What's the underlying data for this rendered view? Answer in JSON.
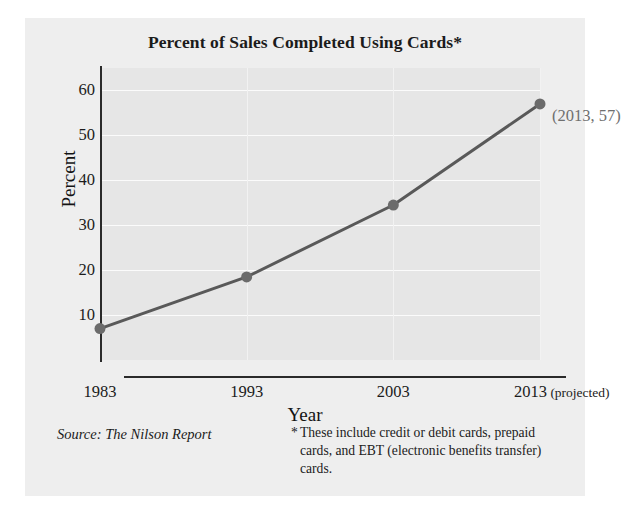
{
  "chart_data": {
    "type": "line",
    "title": "Percent of Sales Completed Using Cards*",
    "xlabel": "Year",
    "ylabel": "Percent",
    "categories": [
      "1983",
      "1993",
      "2003",
      "2013"
    ],
    "x": [
      1983,
      1993,
      2003,
      2013
    ],
    "values": [
      7,
      18.5,
      34.5,
      57
    ],
    "series": [
      {
        "name": "Percent of sales completed using cards",
        "values": [
          7,
          18.5,
          34.5,
          57
        ]
      }
    ],
    "xtick_labels": [
      "1983",
      "1993",
      "2003",
      "2013"
    ],
    "xtick_suffix": "(projected)",
    "ytick_labels": [
      "10",
      "20",
      "30",
      "40",
      "50",
      "60"
    ],
    "ytick_values": [
      10,
      20,
      30,
      40,
      50,
      60
    ],
    "ylim": [
      0,
      65
    ],
    "xlim": [
      1983,
      2013
    ],
    "grid": true,
    "legend": false,
    "annotations": [
      {
        "label": "(2013, 57)",
        "x": 2013,
        "y": 57
      }
    ],
    "colors": {
      "line": "#595959",
      "marker": "#6b6b6b",
      "axis": "#2a2a2a",
      "plot_background": "#e6e6e6",
      "panel_background": "#eeeeee",
      "gridline": "#fbfbfb",
      "annotation_text": "#6f6f6f",
      "text": "#1b1b1b"
    }
  },
  "notes": {
    "source": "Source: The Nilson Report",
    "footnote_marker": "*",
    "footnote_text": "These include credit or debit cards, prepaid cards, and EBT (electronic benefits transfer) cards."
  }
}
